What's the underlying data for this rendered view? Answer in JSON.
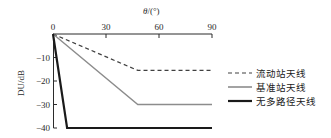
{
  "chart_data": {
    "type": "line",
    "title": "",
    "xlabel": "θ/(°)",
    "ylabel": "DU/dB",
    "xlim": [
      0,
      90
    ],
    "ylim": [
      -40,
      0
    ],
    "xticks": [
      0,
      30,
      60,
      90
    ],
    "xtick_labels": [
      "0",
      "30",
      "60",
      "90"
    ],
    "yticks": [
      -10,
      -20,
      -30,
      -40
    ],
    "ytick_labels": [
      "−10",
      "−20",
      "−30",
      "−40"
    ],
    "grid": false,
    "xaxis_position": "top",
    "legend_position": "right-outside",
    "series": [
      {
        "name": "流动站天线",
        "style": "dashed",
        "color": "#404040",
        "width": 1.2,
        "x": [
          0,
          48,
          90
        ],
        "y": [
          0,
          -15.5,
          -15.5
        ]
      },
      {
        "name": "基准站天线",
        "style": "solid",
        "color": "#8c8c8c",
        "width": 1.4,
        "x": [
          0,
          48,
          90
        ],
        "y": [
          0,
          -30,
          -30
        ]
      },
      {
        "name": "无多路径天线",
        "style": "solid",
        "color": "#1a1a1a",
        "width": 2.2,
        "x": [
          0,
          8,
          90
        ],
        "y": [
          0,
          -40,
          -40
        ]
      }
    ]
  },
  "axis": {
    "x_title": "θ/(°)",
    "y_title": "DU/dB"
  },
  "legend": {
    "items": [
      {
        "label": "流动站天线",
        "swatch": "dashed-line-swatch",
        "color": "#404040"
      },
      {
        "label": "基准站天线",
        "swatch": "solid-line-swatch",
        "color": "#8c8c8c"
      },
      {
        "label": "无多路径天线",
        "swatch": "thick-solid-line-swatch",
        "color": "#1a1a1a"
      }
    ]
  }
}
